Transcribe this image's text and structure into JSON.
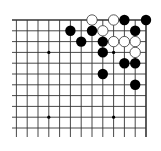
{
  "board": {
    "description": "Go board, top-right corner section (19x19)",
    "size": 19,
    "visible_columns": [
      7,
      19
    ],
    "visible_rows": [
      1,
      11
    ],
    "line_color": "#333333",
    "background": "#ffffff",
    "hoshi": [
      {
        "col": 10,
        "row": 4
      },
      {
        "col": 16,
        "row": 4
      },
      {
        "col": 10,
        "row": 10
      },
      {
        "col": 16,
        "row": 10
      }
    ],
    "stones": [
      {
        "color": "white",
        "col": 14,
        "row": 1
      },
      {
        "color": "white",
        "col": 16,
        "row": 1
      },
      {
        "color": "black",
        "col": 17,
        "row": 1
      },
      {
        "color": "black",
        "col": 19,
        "row": 1
      },
      {
        "color": "black",
        "col": 12,
        "row": 2
      },
      {
        "color": "black",
        "col": 14,
        "row": 2
      },
      {
        "color": "white",
        "col": 15,
        "row": 2
      },
      {
        "color": "black",
        "col": 18,
        "row": 2
      },
      {
        "color": "black",
        "col": 13,
        "row": 3
      },
      {
        "color": "black",
        "col": 15,
        "row": 3
      },
      {
        "color": "white",
        "col": 16,
        "row": 3
      },
      {
        "color": "white",
        "col": 17,
        "row": 3
      },
      {
        "color": "white",
        "col": 18,
        "row": 3
      },
      {
        "color": "black",
        "col": 15,
        "row": 4
      },
      {
        "color": "white",
        "col": 18,
        "row": 4
      },
      {
        "color": "black",
        "col": 17,
        "row": 5
      },
      {
        "color": "black",
        "col": 18,
        "row": 5
      },
      {
        "color": "black",
        "col": 15,
        "row": 6
      },
      {
        "color": "black",
        "col": 18,
        "row": 7
      }
    ]
  }
}
